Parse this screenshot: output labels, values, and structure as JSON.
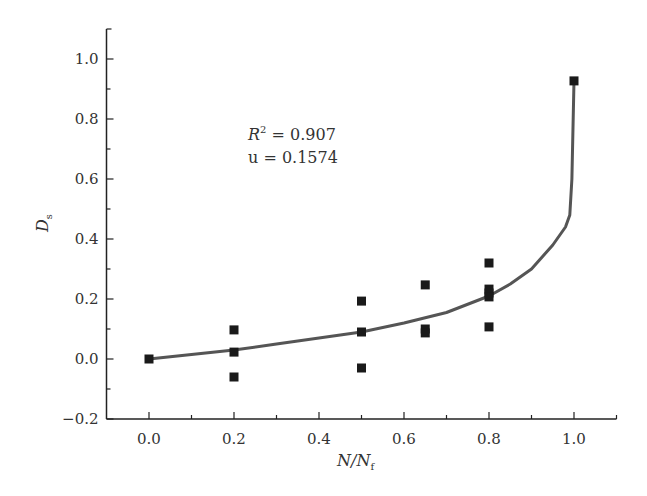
{
  "chart_data": {
    "type": "scatter",
    "title": "",
    "xlabel": "N/N_f",
    "ylabel": "D_s",
    "xlim": [
      -0.1,
      1.1
    ],
    "ylim": [
      -0.2,
      1.1
    ],
    "grid": false,
    "legend": null,
    "x_ticks": [
      "0.0",
      "0.2",
      "0.4",
      "0.6",
      "0.8",
      "1.0"
    ],
    "y_ticks": [
      "-0.2",
      "0.0",
      "0.2",
      "0.4",
      "0.6",
      "0.8",
      "1.0"
    ],
    "annotations": [
      "R² = 0.907",
      "u = 0.1574"
    ],
    "series": [
      {
        "name": "measured",
        "marker": "square",
        "points": [
          [
            0.0,
            0.0
          ],
          [
            0.2,
            0.097
          ],
          [
            0.2,
            0.023
          ],
          [
            0.2,
            -0.06
          ],
          [
            0.5,
            0.193
          ],
          [
            0.5,
            0.09
          ],
          [
            0.5,
            -0.03
          ],
          [
            0.65,
            0.247
          ],
          [
            0.65,
            0.1
          ],
          [
            0.65,
            0.087
          ],
          [
            0.8,
            0.32
          ],
          [
            0.8,
            0.233
          ],
          [
            0.8,
            0.22
          ],
          [
            0.8,
            0.207
          ],
          [
            0.8,
            0.107
          ],
          [
            1.0,
            0.927
          ]
        ]
      },
      {
        "name": "fit",
        "line": true,
        "points": [
          [
            0.0,
            0.0
          ],
          [
            0.1,
            0.015
          ],
          [
            0.2,
            0.03
          ],
          [
            0.3,
            0.05
          ],
          [
            0.4,
            0.07
          ],
          [
            0.5,
            0.09
          ],
          [
            0.6,
            0.12
          ],
          [
            0.7,
            0.155
          ],
          [
            0.8,
            0.21
          ],
          [
            0.85,
            0.25
          ],
          [
            0.9,
            0.3
          ],
          [
            0.95,
            0.38
          ],
          [
            0.98,
            0.44
          ],
          [
            0.99,
            0.48
          ],
          [
            0.995,
            0.6
          ],
          [
            1.0,
            0.927
          ]
        ]
      }
    ]
  },
  "labels": {
    "x_axis": "N/N",
    "x_axis_sub": "f",
    "y_axis": "D",
    "y_axis_sub": "s",
    "annot_r2_prefix": "R",
    "annot_r2_sup": "2",
    "annot_r2_value": " = 0.907",
    "annot_u": "u = 0.1574"
  }
}
